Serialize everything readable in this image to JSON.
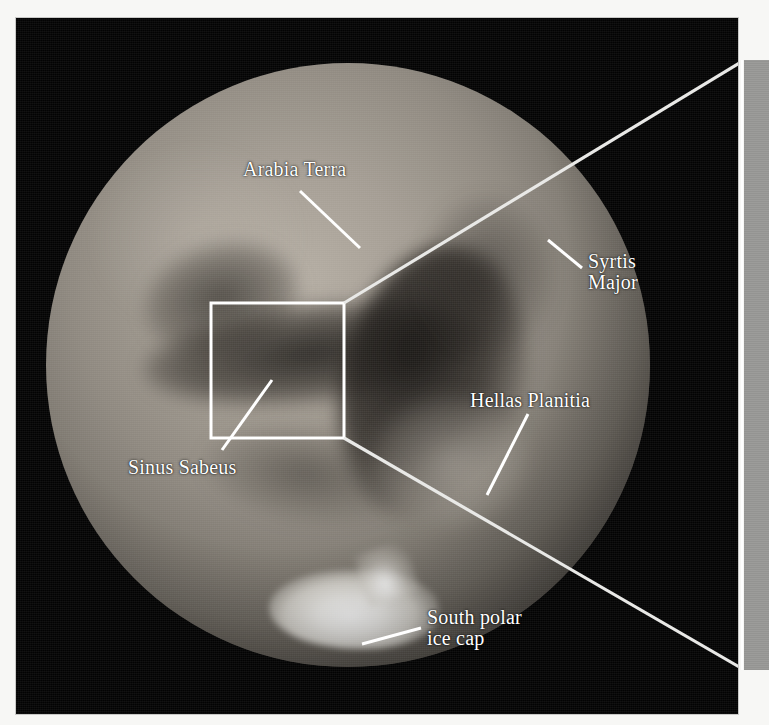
{
  "figure": {
    "type": "annotated-photograph",
    "view": "telescopic full-disk view of Mars with labelled albedo features",
    "background_color": "#ffffff",
    "plate_color": "#030303"
  },
  "photo_plate": {
    "name": "mars-photograph",
    "x": 16,
    "y": 18,
    "width": 722,
    "height": 696
  },
  "globe": {
    "name": "mars-disk",
    "center_x": 348,
    "center_y": 365,
    "radius": 302,
    "surface_color": "#a49d93",
    "shadow_color": "#171614"
  },
  "detail_box": {
    "name": "detail-region-box",
    "x": 211,
    "y": 303,
    "width": 133,
    "height": 135,
    "stroke_color": "#ffffff",
    "stroke_width": 3
  },
  "callout": {
    "name": "detail-callout",
    "description": "two white lines fanning from the detail box to the grey inset band at the right edge",
    "line_color": "#e8e8e6",
    "upper_line": {
      "x1": 344,
      "y1": 303,
      "x2": 741,
      "y2": 62
    },
    "lower_line": {
      "x1": 344,
      "y1": 438,
      "x2": 741,
      "y2": 668
    }
  },
  "inset_band": {
    "name": "inset-panel-edge",
    "x": 744,
    "y": 60,
    "width": 25,
    "height": 610,
    "color": "#9c9c9a"
  },
  "labels": [
    {
      "id": "arabia-terra",
      "text": "Arabia Terra",
      "lines": [
        "Arabia Terra"
      ],
      "x": 243,
      "y": 159,
      "leader": {
        "x1": 300,
        "y1": 191,
        "x2": 360,
        "y2": 248
      },
      "color": "#ffffff"
    },
    {
      "id": "syrtis-major",
      "text": "Syrtis Major",
      "lines": [
        "Syrtis",
        "Major"
      ],
      "x": 588,
      "y": 251,
      "leader": {
        "x1": 582,
        "y1": 268,
        "x2": 548,
        "y2": 240
      },
      "color": "#ffffff"
    },
    {
      "id": "hellas-planitia",
      "text": "Hellas Planitia",
      "lines": [
        "Hellas Planitia"
      ],
      "x": 470,
      "y": 390,
      "leader": {
        "x1": 528,
        "y1": 414,
        "x2": 487,
        "y2": 495
      },
      "color": "#ffffff"
    },
    {
      "id": "sinus-sabeus",
      "text": "Sinus Sabeus",
      "lines": [
        "Sinus Sabeus"
      ],
      "x": 128,
      "y": 457,
      "leader": {
        "x1": 222,
        "y1": 450,
        "x2": 272,
        "y2": 380
      },
      "color": "#ffffff"
    },
    {
      "id": "south-polar-ice-cap",
      "text": "South polar ice cap",
      "lines": [
        "South polar",
        "ice cap"
      ],
      "x": 427,
      "y": 607,
      "leader": {
        "x1": 421,
        "y1": 628,
        "x2": 362,
        "y2": 644
      },
      "color": "#ffffff"
    }
  ],
  "features": {
    "polar_cap": {
      "name": "south-polar-ice-cap-feature",
      "color": "#ffffff"
    },
    "dark_albedo": {
      "name": "dark-albedo-markings",
      "color": "#1a1815"
    },
    "bright_basin": {
      "name": "hellas-basin-bright",
      "color": "#d4cec4"
    }
  }
}
